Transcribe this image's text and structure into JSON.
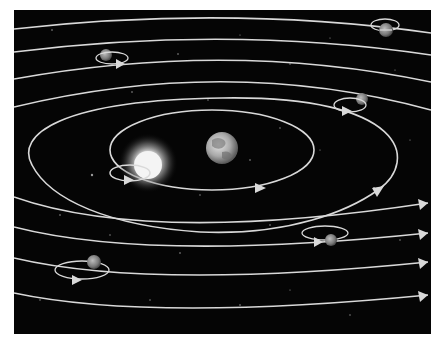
{
  "diagram": {
    "type": "geocentric-model-illustration",
    "background_color": "#050505",
    "page_color": "#ffffff",
    "orbit_color": "#d9d9d9",
    "center_body": {
      "name": "Earth",
      "x": 222,
      "y": 148,
      "r": 16
    },
    "sun": {
      "name": "Sun",
      "x": 148,
      "y": 165,
      "r": 17
    },
    "orbits": [
      {
        "name": "sun-orbit",
        "kind": "ellipse",
        "cx": 212,
        "cy": 150,
        "rx": 102,
        "ry": 40,
        "arrow": {
          "x": 258,
          "y": 188
        }
      },
      {
        "name": "second-orbit",
        "kind": "ellipse",
        "cx": 205,
        "cy": 152,
        "rx": 176,
        "ry": 56,
        "arrow": {
          "x": 378,
          "y": 190
        }
      }
    ],
    "planets_with_epicycles": [
      {
        "name": "planet-upper-left",
        "x": 106,
        "y": 55,
        "r": 6
      },
      {
        "name": "planet-upper-right",
        "x": 386,
        "y": 30,
        "r": 7
      },
      {
        "name": "planet-right",
        "x": 362,
        "y": 99,
        "r": 6
      },
      {
        "name": "planet-lower-right",
        "x": 330,
        "y": 240,
        "r": 6
      },
      {
        "name": "planet-lower-left",
        "x": 94,
        "y": 262,
        "r": 7
      }
    ],
    "labels": []
  }
}
